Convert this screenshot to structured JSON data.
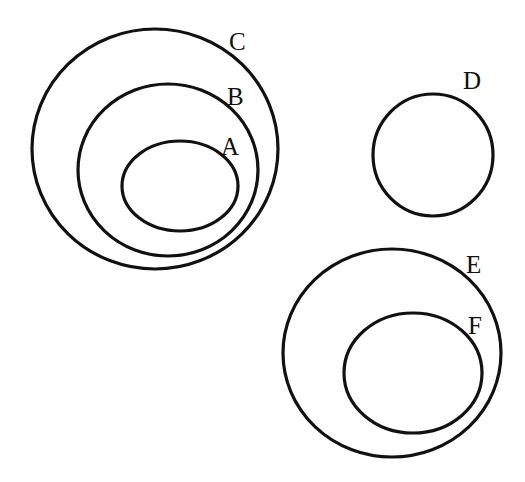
{
  "diagram": {
    "type": "euler-diagram",
    "stroke_color": "#111111",
    "background": "#ffffff",
    "sets": [
      {
        "id": "C",
        "label": "C",
        "cx": 155,
        "cy": 149,
        "rx": 123,
        "ry": 120,
        "contains": [
          "B"
        ]
      },
      {
        "id": "B",
        "label": "B",
        "cx": 168,
        "cy": 170,
        "rx": 90,
        "ry": 86,
        "contains": [
          "A"
        ]
      },
      {
        "id": "A",
        "label": "A",
        "cx": 180,
        "cy": 186,
        "rx": 58,
        "ry": 45,
        "contains": []
      },
      {
        "id": "D",
        "label": "D",
        "cx": 433,
        "cy": 155,
        "rx": 60,
        "ry": 61,
        "contains": []
      },
      {
        "id": "E",
        "label": "E",
        "cx": 392,
        "cy": 353,
        "rx": 109,
        "ry": 104,
        "contains": [
          "F"
        ]
      },
      {
        "id": "F",
        "label": "F",
        "cx": 413,
        "cy": 373,
        "rx": 69,
        "ry": 60,
        "contains": []
      }
    ]
  }
}
